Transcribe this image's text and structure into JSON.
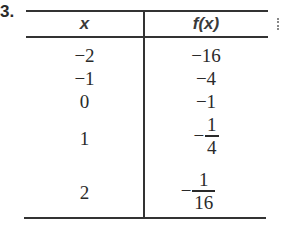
{
  "problem": {
    "number": "3."
  },
  "table": {
    "headers": {
      "x": "x",
      "fx": "f(x)"
    },
    "rows": [
      {
        "x": "−2",
        "fx": {
          "type": "int",
          "text": "−16"
        }
      },
      {
        "x": "−1",
        "fx": {
          "type": "int",
          "text": "−4"
        }
      },
      {
        "x": "0",
        "fx": {
          "type": "int",
          "text": "−1"
        }
      },
      {
        "x": "1",
        "fx": {
          "type": "fraction",
          "sign": "−",
          "numerator": "1",
          "denominator": "4"
        }
      },
      {
        "x": "2",
        "fx": {
          "type": "fraction",
          "sign": "−",
          "numerator": "1",
          "denominator": "16"
        }
      }
    ]
  }
}
